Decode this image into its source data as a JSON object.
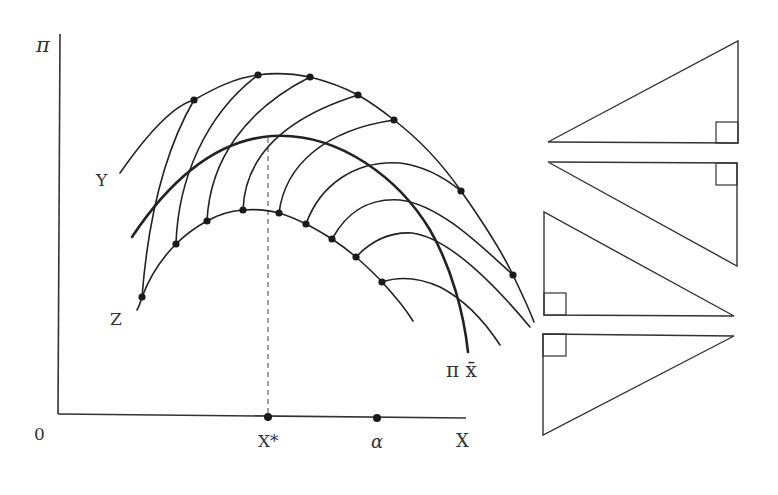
{
  "diagram": {
    "labels": {
      "y_axis": "π",
      "origin": "0",
      "x_axis": "X",
      "x_star": "X*",
      "alpha": "α",
      "curve_y": "Y",
      "curve_z": "Z",
      "curve_pi_xbar": "π x̄"
    },
    "axes": {
      "x_start": [
        58,
        414
      ],
      "x_end": [
        466,
        418
      ],
      "y_top": [
        60,
        34
      ],
      "y_bottom": [
        58,
        414
      ]
    },
    "x_axis_points": [
      {
        "name": "X*",
        "pos": [
          268,
          418
        ]
      },
      {
        "name": "α",
        "pos": [
          377,
          418
        ]
      }
    ],
    "curve_y_dots": [
      [
        194,
        100
      ],
      [
        258,
        75
      ],
      [
        310,
        77
      ],
      [
        358,
        95
      ],
      [
        394,
        120
      ],
      [
        461,
        191
      ],
      [
        513,
        275
      ]
    ],
    "curve_z_dots": [
      [
        142,
        297
      ],
      [
        176,
        244
      ],
      [
        207,
        221
      ],
      [
        243,
        210
      ],
      [
        279,
        213
      ],
      [
        306,
        224
      ],
      [
        332,
        239
      ],
      [
        356,
        257
      ],
      [
        382,
        282
      ]
    ],
    "triangles": [
      {
        "points": [
          [
            548,
            142
          ],
          [
            738,
            143
          ],
          [
            738,
            41
          ]
        ],
        "right_angle_square": [
          716,
          122,
          22,
          21
        ]
      },
      {
        "points": [
          [
            548,
            162
          ],
          [
            737,
            163
          ],
          [
            737,
            266
          ]
        ],
        "right_angle_square": [
          716,
          163,
          21,
          22
        ]
      },
      {
        "points": [
          [
            544,
            212
          ],
          [
            544,
            315
          ],
          [
            734,
            316
          ]
        ],
        "right_angle_square": [
          544,
          293,
          22,
          22
        ]
      },
      {
        "points": [
          [
            543,
            334
          ],
          [
            734,
            336
          ],
          [
            543,
            435
          ]
        ],
        "right_angle_square": [
          543,
          334,
          23,
          22
        ]
      }
    ],
    "colors": {
      "stroke": "#222222",
      "background": "#ffffff"
    }
  }
}
